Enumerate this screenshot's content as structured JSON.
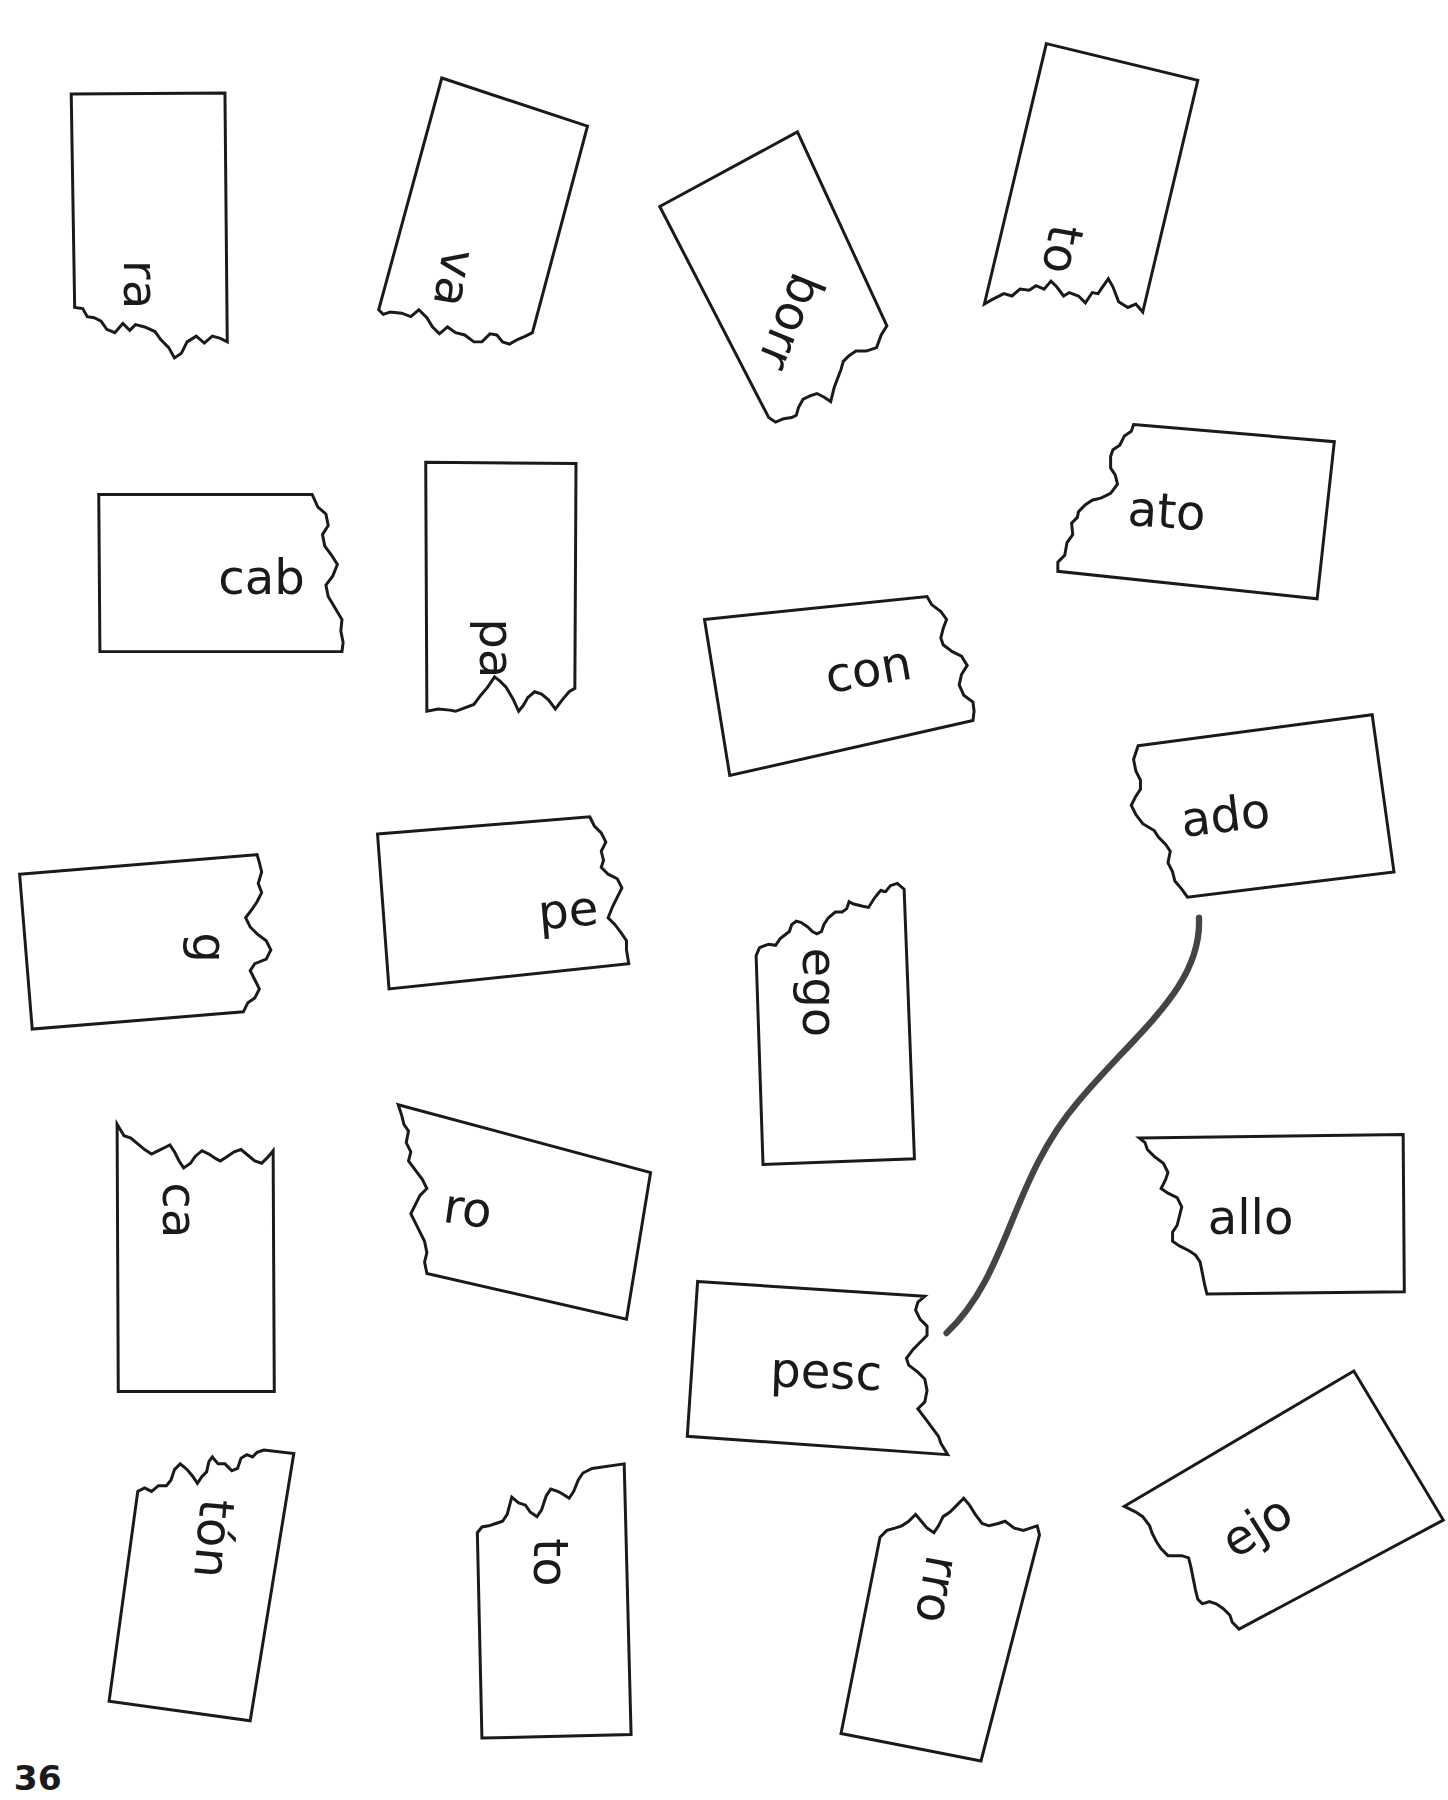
{
  "worksheet": {
    "page_number": "36",
    "cards": [
      {
        "id": "c1",
        "text": "ra"
      },
      {
        "id": "c2",
        "text": "va"
      },
      {
        "id": "c3",
        "text": "borr"
      },
      {
        "id": "c4",
        "text": "to"
      },
      {
        "id": "c5",
        "text": "cab"
      },
      {
        "id": "c6",
        "text": "pa"
      },
      {
        "id": "c7",
        "text": "ato"
      },
      {
        "id": "c8",
        "text": "con"
      },
      {
        "id": "c9",
        "text": "ado"
      },
      {
        "id": "c10",
        "text": "g"
      },
      {
        "id": "c11",
        "text": "pe"
      },
      {
        "id": "c12",
        "text": "ego"
      },
      {
        "id": "c13",
        "text": "ca"
      },
      {
        "id": "c14",
        "text": "ro"
      },
      {
        "id": "c15",
        "text": "allo"
      },
      {
        "id": "c16",
        "text": "pesc"
      },
      {
        "id": "c17",
        "text": "tón"
      },
      {
        "id": "c18",
        "text": "to"
      },
      {
        "id": "c19",
        "text": "rro"
      },
      {
        "id": "c20",
        "text": "ejo"
      }
    ],
    "drawn_connection": {
      "from": "pesc",
      "to": "ado",
      "color": "#444444"
    }
  }
}
